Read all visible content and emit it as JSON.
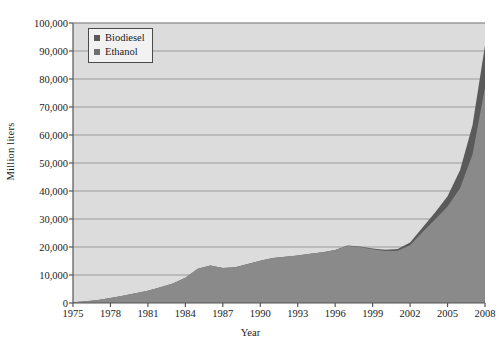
{
  "chart_data": {
    "type": "area",
    "stacked": true,
    "title": "",
    "xlabel": "Year",
    "ylabel": "Million liters",
    "xlim": [
      1975,
      2008
    ],
    "ylim": [
      0,
      100000
    ],
    "ytick_interval": 10000,
    "grid": true,
    "grid_axis": "y",
    "legend_position": "top-left",
    "x": [
      1975,
      1976,
      1977,
      1978,
      1979,
      1980,
      1981,
      1982,
      1983,
      1984,
      1985,
      1986,
      1987,
      1988,
      1989,
      1990,
      1991,
      1992,
      1993,
      1994,
      1995,
      1996,
      1997,
      1998,
      1999,
      2000,
      2001,
      2002,
      2003,
      2004,
      2005,
      2006,
      2007,
      2008
    ],
    "xtick_labels": [
      "1975",
      "1978",
      "1981",
      "1984",
      "1987",
      "1990",
      "1993",
      "1996",
      "1999",
      "2002",
      "2005",
      "2008"
    ],
    "ytick_labels": [
      "0",
      "10,000",
      "20,000",
      "30,000",
      "40,000",
      "50,000",
      "60,000",
      "70,000",
      "80,000",
      "90,000",
      "100,000"
    ],
    "series": [
      {
        "name": "Ethanol",
        "color": "#8a8a8a",
        "values": [
          300,
          600,
          1100,
          1800,
          2600,
          3500,
          4400,
          5600,
          7000,
          9000,
          12200,
          13400,
          12500,
          12800,
          13900,
          15100,
          16100,
          16500,
          17000,
          17600,
          18100,
          18900,
          20400,
          20000,
          19200,
          18600,
          18700,
          20600,
          25400,
          29800,
          34500,
          41000,
          53000,
          77000
        ]
      },
      {
        "name": "Biodiesel",
        "color": "#5a5a5a",
        "values": [
          0,
          0,
          0,
          0,
          0,
          0,
          0,
          0,
          0,
          0,
          0,
          0,
          0,
          0,
          0,
          0,
          0,
          0,
          0,
          0,
          0,
          0,
          100,
          200,
          300,
          400,
          600,
          1000,
          1600,
          2500,
          3600,
          6400,
          10500,
          15000
        ]
      }
    ],
    "totals": [
      300,
      600,
      1100,
      1800,
      2600,
      3500,
      4400,
      5600,
      7000,
      9000,
      12200,
      13400,
      12500,
      12800,
      13900,
      15100,
      16100,
      16500,
      17000,
      17600,
      18100,
      18900,
      20500,
      20200,
      19500,
      19000,
      19300,
      21600,
      27000,
      32300,
      38100,
      47400,
      63500,
      92000
    ]
  },
  "style": {
    "plot_background": "#dcdcdc",
    "gridline_color": "#9a9a9a",
    "axis_color": "#555555",
    "page_background": "#ffffff",
    "legend_border": "#4a4a4a",
    "legend_background": "#f2f2f2"
  },
  "legend": {
    "items": [
      {
        "label": "Biodiesel",
        "swatch": "#5a5a5a"
      },
      {
        "label": "Ethanol",
        "swatch": "#6f6f6f"
      }
    ]
  }
}
